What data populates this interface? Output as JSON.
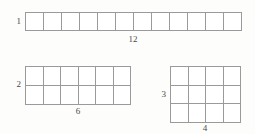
{
  "figures": [
    {
      "id": "figure-1",
      "name": "array-1-by-12",
      "rows": 1,
      "cols": 12,
      "side_label": "1",
      "bottom_label": "12",
      "cell_count": 12
    },
    {
      "id": "figure-2",
      "name": "array-2-by-6",
      "rows": 2,
      "cols": 6,
      "side_label": "2",
      "bottom_label": "6",
      "cell_count": 12
    },
    {
      "id": "figure-3",
      "name": "array-3-by-4",
      "rows": 3,
      "cols": 4,
      "side_label": "3",
      "bottom_label": "4",
      "cell_count": 12
    }
  ],
  "style": {
    "background": "#fdfdfc",
    "grid_line_color": "#9a9a9a",
    "cell_fill": "#ffffff",
    "label_color": "#4a4a4a"
  }
}
